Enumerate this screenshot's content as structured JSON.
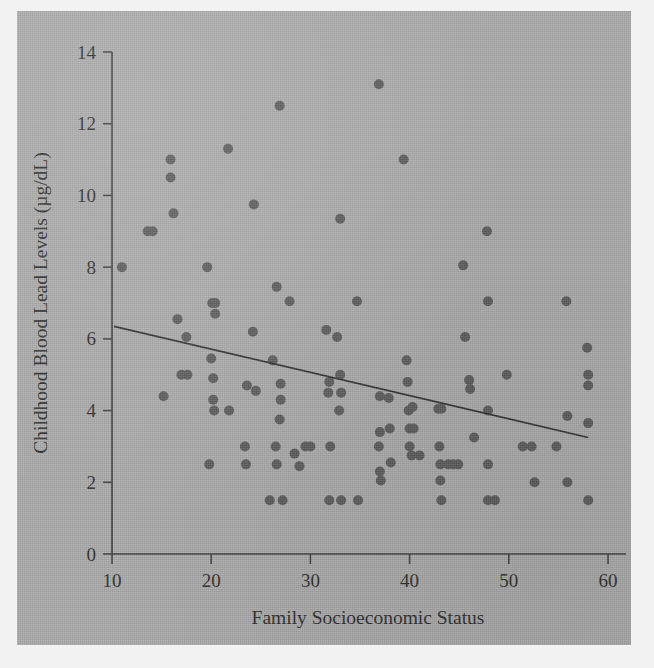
{
  "figure": {
    "background_color": "#aaaaaa",
    "page_color": "#f2f2f2",
    "marker_color": "#5a5a5a",
    "axis_color": "#3a3a3a",
    "line_color": "#2e2e2e"
  },
  "chart_data": {
    "type": "scatter",
    "title": "",
    "xlabel": "Family Socioeconomic Status",
    "ylabel": "Childhood Blood Lead Levels (µg/dL)",
    "xlim": [
      10,
      60
    ],
    "ylim": [
      0,
      14
    ],
    "xticks": [
      10,
      20,
      30,
      40,
      50,
      60
    ],
    "yticks": [
      0,
      2,
      4,
      6,
      8,
      10,
      12,
      14
    ],
    "xtick_labels": [
      "10",
      "20",
      "30",
      "40",
      "50",
      "60"
    ],
    "ytick_labels": [
      "0",
      "2",
      "4",
      "6",
      "8",
      "10",
      "12",
      "14"
    ],
    "grid": false,
    "legend": null,
    "marker_radius_px": 5,
    "trend_line": {
      "type": "linear-fit",
      "x_start": 10.2,
      "y_start": 6.35,
      "x_end": 58.0,
      "y_end": 3.25
    },
    "points": [
      [
        11.0,
        8.0
      ],
      [
        13.6,
        9.0
      ],
      [
        14.1,
        9.0
      ],
      [
        15.2,
        4.4
      ],
      [
        15.9,
        11.0
      ],
      [
        15.9,
        10.5
      ],
      [
        16.2,
        9.5
      ],
      [
        16.6,
        6.55
      ],
      [
        17.0,
        5.0
      ],
      [
        17.5,
        6.05
      ],
      [
        17.6,
        5.0
      ],
      [
        19.6,
        8.0
      ],
      [
        19.8,
        2.5
      ],
      [
        20.0,
        5.45
      ],
      [
        20.1,
        7.0
      ],
      [
        20.4,
        7.0
      ],
      [
        20.2,
        4.3
      ],
      [
        20.3,
        4.0
      ],
      [
        20.4,
        6.7
      ],
      [
        20.2,
        4.9
      ],
      [
        21.7,
        11.3
      ],
      [
        21.8,
        4.0
      ],
      [
        23.4,
        3.0
      ],
      [
        23.5,
        2.5
      ],
      [
        23.6,
        4.7
      ],
      [
        24.2,
        6.2
      ],
      [
        24.3,
        9.75
      ],
      [
        24.5,
        4.55
      ],
      [
        25.9,
        1.5
      ],
      [
        26.2,
        5.4
      ],
      [
        26.6,
        7.45
      ],
      [
        26.5,
        3.0
      ],
      [
        26.6,
        2.5
      ],
      [
        26.9,
        12.5
      ],
      [
        27.0,
        4.75
      ],
      [
        27.0,
        4.3
      ],
      [
        26.9,
        3.75
      ],
      [
        27.2,
        1.5
      ],
      [
        27.9,
        7.05
      ],
      [
        28.4,
        2.8
      ],
      [
        28.9,
        2.45
      ],
      [
        29.5,
        3.0
      ],
      [
        30.0,
        3.0
      ],
      [
        31.6,
        6.25
      ],
      [
        31.8,
        4.5
      ],
      [
        31.9,
        4.8
      ],
      [
        32.0,
        3.0
      ],
      [
        31.9,
        1.5
      ],
      [
        32.7,
        6.05
      ],
      [
        32.9,
        4.0
      ],
      [
        33.0,
        5.0
      ],
      [
        33.1,
        4.5
      ],
      [
        33.0,
        9.35
      ],
      [
        33.1,
        1.5
      ],
      [
        34.7,
        7.05
      ],
      [
        34.8,
        1.5
      ],
      [
        36.9,
        13.1
      ],
      [
        37.0,
        4.4
      ],
      [
        37.0,
        3.4
      ],
      [
        36.9,
        3.0
      ],
      [
        37.0,
        2.3
      ],
      [
        37.1,
        2.05
      ],
      [
        37.9,
        4.35
      ],
      [
        38.0,
        3.5
      ],
      [
        38.1,
        2.55
      ],
      [
        39.4,
        11.0
      ],
      [
        39.7,
        5.4
      ],
      [
        39.8,
        4.8
      ],
      [
        39.9,
        4.0
      ],
      [
        40.0,
        3.5
      ],
      [
        40.0,
        3.0
      ],
      [
        40.2,
        2.75
      ],
      [
        40.3,
        4.1
      ],
      [
        40.4,
        3.5
      ],
      [
        41.0,
        2.75
      ],
      [
        42.9,
        4.05
      ],
      [
        43.2,
        4.05
      ],
      [
        43.0,
        3.0
      ],
      [
        43.1,
        2.5
      ],
      [
        43.1,
        2.05
      ],
      [
        43.2,
        1.5
      ],
      [
        43.9,
        2.5
      ],
      [
        44.4,
        2.5
      ],
      [
        44.9,
        2.5
      ],
      [
        45.4,
        8.05
      ],
      [
        45.6,
        6.05
      ],
      [
        46.0,
        4.85
      ],
      [
        46.1,
        4.6
      ],
      [
        46.5,
        3.25
      ],
      [
        47.8,
        9.0
      ],
      [
        47.9,
        7.05
      ],
      [
        47.9,
        4.0
      ],
      [
        47.9,
        2.5
      ],
      [
        47.9,
        1.5
      ],
      [
        48.6,
        1.5
      ],
      [
        49.8,
        5.0
      ],
      [
        51.4,
        3.0
      ],
      [
        52.3,
        3.0
      ],
      [
        52.6,
        2.0
      ],
      [
        54.8,
        3.0
      ],
      [
        55.8,
        7.05
      ],
      [
        55.9,
        3.85
      ],
      [
        55.9,
        2.0
      ],
      [
        57.9,
        5.75
      ],
      [
        58.0,
        5.0
      ],
      [
        58.0,
        4.7
      ],
      [
        58.0,
        3.65
      ],
      [
        58.0,
        1.5
      ]
    ]
  }
}
